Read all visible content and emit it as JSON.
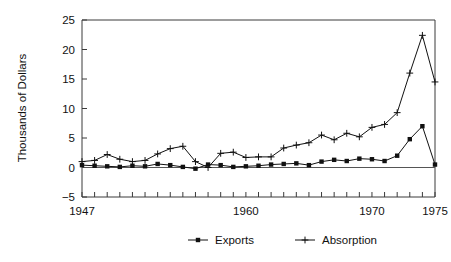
{
  "chart_data": {
    "type": "line",
    "title": "",
    "xlabel": "",
    "ylabel": "Thousands of Dollars",
    "xlim": [
      1947,
      1975
    ],
    "ylim": [
      -5,
      25
    ],
    "y_ticks": [
      -5,
      0,
      5,
      10,
      15,
      20,
      25
    ],
    "y_tick_labels": [
      "−5",
      "0",
      "5",
      "10",
      "15",
      "20",
      "25"
    ],
    "x_ticks_labeled": [
      1947,
      1960,
      1970,
      1975
    ],
    "x_tick_labels": [
      "1947",
      "1960",
      "1970",
      "1975"
    ],
    "x_minor_tick_interval": 1,
    "grid": false,
    "legend_position": "bottom-center",
    "x": [
      1947,
      1948,
      1949,
      1950,
      1951,
      1952,
      1953,
      1954,
      1955,
      1956,
      1957,
      1958,
      1959,
      1960,
      1961,
      1962,
      1963,
      1964,
      1965,
      1966,
      1967,
      1968,
      1969,
      1970,
      1971,
      1972,
      1973,
      1974,
      1975
    ],
    "series": [
      {
        "name": "Exports",
        "marker": "filled-square",
        "values": [
          0.4,
          0.3,
          0.2,
          0.1,
          0.3,
          0.2,
          0.6,
          0.4,
          0.1,
          -0.2,
          0.5,
          0.4,
          0.1,
          0.2,
          0.3,
          0.5,
          0.6,
          0.7,
          0.4,
          1.0,
          1.3,
          1.1,
          1.5,
          1.4,
          1.1,
          2.0,
          4.8,
          7.0,
          0.5
        ]
      },
      {
        "name": "Absorption",
        "marker": "plus",
        "values": [
          1.0,
          1.2,
          2.2,
          1.4,
          1.0,
          1.2,
          2.3,
          3.2,
          3.6,
          1.0,
          0.0,
          2.4,
          2.6,
          1.7,
          1.8,
          1.8,
          3.3,
          3.8,
          4.2,
          5.5,
          4.7,
          5.8,
          5.2,
          6.8,
          7.3,
          9.3,
          16.0,
          22.4,
          14.5
        ]
      }
    ]
  },
  "legend": {
    "items": [
      {
        "label": "Exports",
        "marker": "filled-square"
      },
      {
        "label": "Absorption",
        "marker": "plus"
      }
    ]
  }
}
